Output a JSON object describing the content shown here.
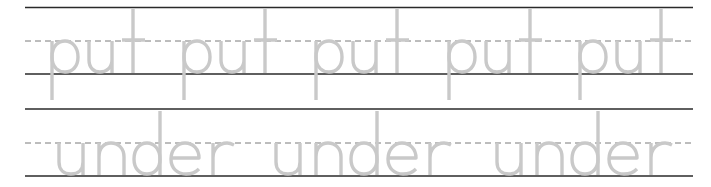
{
  "worksheet": {
    "rows": [
      {
        "word": "put",
        "repetitions": 5,
        "words": [
          "put",
          "put",
          "put",
          "put",
          "put"
        ],
        "word_x": [
          52,
          184,
          316,
          449,
          580
        ]
      },
      {
        "word": "under",
        "repetitions": 3,
        "words": [
          "under",
          "under",
          "under"
        ],
        "word_x": [
          59,
          276,
          497
        ]
      }
    ],
    "colors": {
      "trace_letters": "#c9c9c9",
      "solid_rule": "#2a2a2a",
      "dashed_rule": "#7a7a7a",
      "background": "#ffffff"
    }
  }
}
